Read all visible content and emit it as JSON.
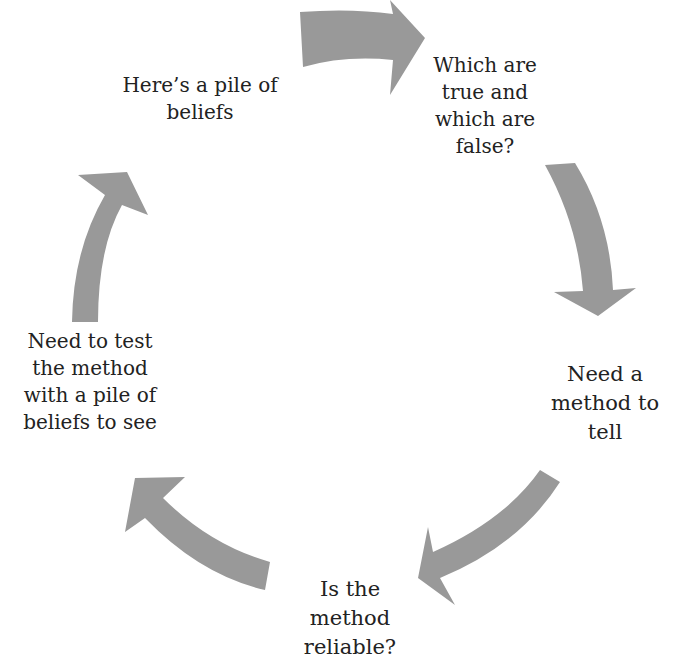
{
  "diagram": {
    "type": "cycle",
    "arrow_color": "#999999",
    "text_color": "#222222",
    "nodes": [
      {
        "id": "beliefs",
        "lines": [
          "Here’s a pile of",
          "beliefs"
        ]
      },
      {
        "id": "true-false",
        "lines": [
          "Which are",
          "true and",
          "which are",
          "false?"
        ]
      },
      {
        "id": "need-method",
        "lines": [
          "Need a",
          "method to",
          "tell"
        ]
      },
      {
        "id": "reliable",
        "lines": [
          "Is the",
          "method",
          "reliable?"
        ]
      },
      {
        "id": "test-method",
        "lines": [
          "Need to test",
          "the method",
          "with a pile of",
          "beliefs to see"
        ]
      }
    ],
    "edges": [
      {
        "from": "beliefs",
        "to": "true-false"
      },
      {
        "from": "true-false",
        "to": "need-method"
      },
      {
        "from": "need-method",
        "to": "reliable"
      },
      {
        "from": "reliable",
        "to": "test-method"
      },
      {
        "from": "test-method",
        "to": "beliefs"
      }
    ]
  }
}
